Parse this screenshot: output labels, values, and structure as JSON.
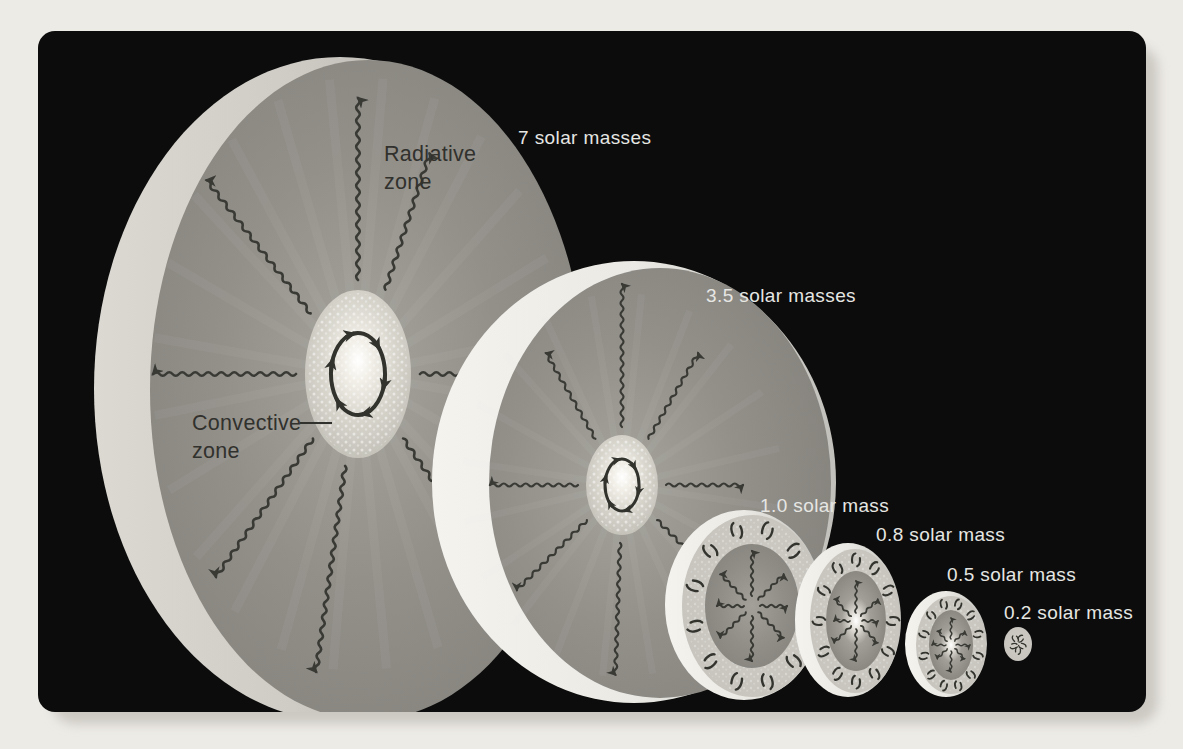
{
  "page": {
    "background": "#edebe6"
  },
  "panel": {
    "background": "#0c0c0c"
  },
  "colors": {
    "radiative_zone_fill": "#8d8a85",
    "convective_envelope_fill": "#c9c7c0",
    "star_surface_highlight": "#f2f1ec",
    "arrow": "#3a3a35",
    "label_light": "#e6e6e3",
    "label_dark": "#31312d"
  },
  "zone_labels": {
    "radiative": {
      "line1": "Radiative",
      "line2": "zone"
    },
    "convective": {
      "line1": "Convective",
      "line2": "zone"
    }
  },
  "stars": [
    {
      "label": "7 solar masses",
      "core": "convective zone",
      "envelope": "radiative zone"
    },
    {
      "label": "3.5 solar masses",
      "core": "convective zone",
      "envelope": "radiative zone"
    },
    {
      "label": "1.0 solar mass",
      "core": "radiative zone",
      "envelope": "convective zone"
    },
    {
      "label": "0.8 solar mass",
      "core": "radiative zone",
      "envelope": "convective zone"
    },
    {
      "label": "0.5 solar mass",
      "core": "radiative zone",
      "envelope": "convective zone"
    },
    {
      "label": "0.2 solar mass",
      "structure": "fully convective"
    }
  ]
}
